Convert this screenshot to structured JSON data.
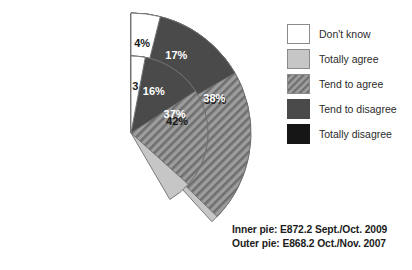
{
  "chart_data": {
    "type": "pie",
    "title": "",
    "subtitle": "",
    "variant": "nested-donut",
    "legend_position": "right",
    "categories": [
      "Don't know",
      "Totally agree",
      "Tend to agree",
      "Tend to disagree",
      "Totally disagree"
    ],
    "series": [
      {
        "name": "Inner pie: E872.2 Sept./Oct. 2009",
        "ring": "inner",
        "values": [
          3,
          42,
          37,
          16,
          3
        ],
        "labels": [
          "3",
          "42%",
          "37%",
          "16%",
          "3"
        ]
      },
      {
        "name": "Outer pie: E868.2 Oct./Nov. 2007",
        "ring": "outer",
        "values": [
          4,
          39,
          38,
          17,
          4
        ],
        "labels": [
          "4%",
          "39%",
          "38%",
          "17%",
          "4%"
        ]
      }
    ],
    "colors": {
      "dont_know": "#ffffff",
      "totally_agree": "#c6c6c6",
      "tend_to_agree": "#9a9a9a",
      "tend_to_disagree": "#4a4a4a",
      "totally_disagree": "#161616",
      "outline": "#6e6e6e",
      "text": "#1a1a1a"
    }
  },
  "legend": {
    "items": [
      {
        "label": "Don't know",
        "swatch": "swatch-white",
        "icon": "legend-swatch-dont-know"
      },
      {
        "label": "Totally agree",
        "swatch": "swatch-lightgray",
        "icon": "legend-swatch-totally-agree"
      },
      {
        "label": "Tend to agree",
        "swatch": "swatch-hatch",
        "icon": "legend-swatch-tend-to-agree"
      },
      {
        "label": "Tend to disagree",
        "swatch": "swatch-darkgray",
        "icon": "legend-swatch-tend-to-disagree"
      },
      {
        "label": "Totally disagree",
        "swatch": "swatch-black",
        "icon": "legend-swatch-totally-disagree"
      }
    ]
  },
  "caption": {
    "line1": "Inner pie: E872.2 Sept./Oct. 2009",
    "line2": "Outer pie: E868.2 Oct./Nov. 2007"
  },
  "outer_labels": {
    "totally_agree": "39%",
    "tend_to_agree": "38%",
    "tend_to_disagree": "17%",
    "totally_disagree": "4%",
    "dont_know": "4%"
  },
  "inner_labels": {
    "totally_agree": "42%",
    "tend_to_agree": "37%",
    "tend_to_disagree": "16%",
    "totally_disagree": "3",
    "dont_know": "3"
  }
}
